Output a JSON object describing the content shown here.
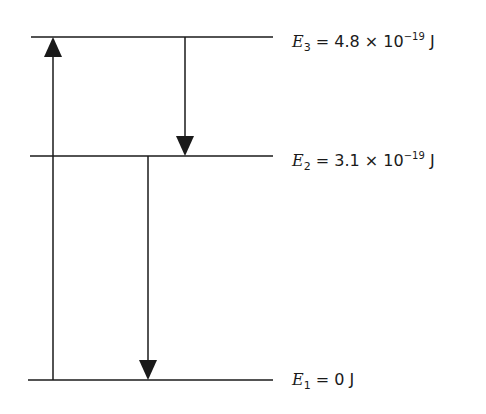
{
  "diagram": {
    "type": "energy-level-diagram",
    "levels": [
      {
        "id": "E3",
        "symbol": "E",
        "subscript": "3",
        "equals": "=",
        "mantissa": "4.8 × 10",
        "exponent": "−19",
        "unit": "J",
        "y": 37,
        "x1": 31,
        "x2": 273
      },
      {
        "id": "E2",
        "symbol": "E",
        "subscript": "2",
        "equals": "=",
        "mantissa": "3.1 × 10",
        "exponent": "−19",
        "unit": "J",
        "y": 156,
        "x1": 30,
        "x2": 273
      },
      {
        "id": "E1",
        "symbol": "E",
        "subscript": "1",
        "equals": "=",
        "mantissa": "0",
        "exponent": "",
        "unit": "J",
        "y": 380,
        "x1": 28,
        "x2": 273
      }
    ],
    "transitions": [
      {
        "from": "E1",
        "to": "E3",
        "direction": "up",
        "x": 53
      },
      {
        "from": "E3",
        "to": "E2",
        "direction": "down",
        "x": 185
      },
      {
        "from": "E2",
        "to": "E1",
        "direction": "down",
        "x": 148
      }
    ],
    "line_color": "#1a1a1a"
  }
}
